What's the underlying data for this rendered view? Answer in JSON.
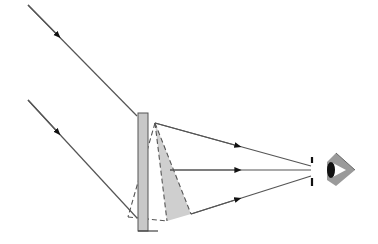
{
  "diagram": {
    "type": "optics-ray-diagram",
    "colors": {
      "ray": "#555555",
      "plate_fill": "#c8c8c8",
      "plate_stroke": "#555555",
      "shaded_cone": "#cfcfcf",
      "dashed": "#555555",
      "eye_cone": "#9a9a9a",
      "pupil": "#111111"
    },
    "incident_rays": [
      {
        "from": [
          28,
          5
        ],
        "to": [
          137,
          116
        ],
        "arrow_at": [
          58,
          36
        ]
      },
      {
        "from": [
          28,
          100
        ],
        "to": [
          137,
          218
        ],
        "arrow_at": [
          58,
          131
        ]
      }
    ],
    "plate": {
      "x": 138,
      "y": 113,
      "width": 10,
      "height": 118
    },
    "apex_point": [
      155,
      123
    ],
    "outgoing_rays": [
      {
        "from": [
          155,
          123
        ],
        "to": [
          311,
          166
        ],
        "arrow_at": [
          238,
          146
        ]
      },
      {
        "from": [
          170,
          170
        ],
        "to": [
          311,
          170
        ],
        "arrow_at": [
          238,
          170
        ]
      },
      {
        "from": [
          191,
          214
        ],
        "to": [
          311,
          176
        ],
        "arrow_at": [
          238,
          199
        ]
      }
    ],
    "aperture": {
      "x": 312,
      "upper": [
        157,
        163
      ],
      "lower": [
        178,
        186
      ]
    },
    "eye": {
      "cone_left": 327,
      "cone_apex_x": 355,
      "top": 153,
      "bottom": 186
    }
  }
}
